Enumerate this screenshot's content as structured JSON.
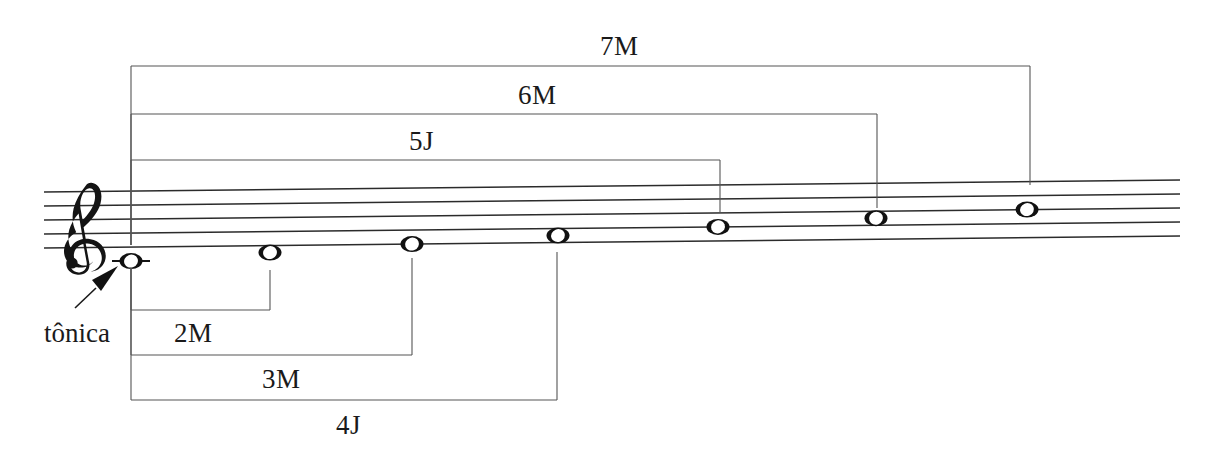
{
  "figure": {
    "kind": "music-staff-intervals",
    "clef": "treble-clef",
    "staff": {
      "line_count": 5,
      "left_x": 44,
      "right_x": 1180,
      "left_top_y": 192,
      "line_spacing": 14,
      "tilt_px": -12,
      "color": "#2b2b2b"
    },
    "tonic": {
      "label": "tônica",
      "arrow": "arrow-up-right",
      "label_x": 44,
      "label_y": 320
    },
    "notes": [
      {
        "id": "note-1",
        "degree": "1",
        "x": 131,
        "staff_pos": -2,
        "ledger": true,
        "name": "tonic-note"
      },
      {
        "id": "note-2",
        "degree": "2",
        "x": 270,
        "staff_pos": -1,
        "ledger": false,
        "name": "second-note"
      },
      {
        "id": "note-3",
        "degree": "3",
        "x": 412,
        "staff_pos": 0,
        "ledger": false,
        "name": "third-note"
      },
      {
        "id": "note-4",
        "degree": "4",
        "x": 558,
        "staff_pos": 1,
        "ledger": false,
        "name": "fourth-note"
      },
      {
        "id": "note-5",
        "degree": "5",
        "x": 718,
        "staff_pos": 2,
        "ledger": false,
        "name": "fifth-note"
      },
      {
        "id": "note-6",
        "degree": "6",
        "x": 876,
        "staff_pos": 3,
        "ledger": false,
        "name": "sixth-note"
      },
      {
        "id": "note-7",
        "degree": "7",
        "x": 1027,
        "staff_pos": 4,
        "ledger": false,
        "name": "seventh-note"
      }
    ],
    "brackets_above": [
      {
        "id": "bracket-5j",
        "label": "5J",
        "x1": 131,
        "x2": 720,
        "bar_y": 160,
        "left_drop_y": 245,
        "right_drop_y": 212,
        "label_x": 409,
        "label_y": 128
      },
      {
        "id": "bracket-6m",
        "label": "6M",
        "x1": 131,
        "x2": 877,
        "bar_y": 114,
        "left_drop_y": 245,
        "right_drop_y": 208,
        "label_x": 518,
        "label_y": 82
      },
      {
        "id": "bracket-7m",
        "label": "7M",
        "x1": 131,
        "x2": 1030,
        "bar_y": 66,
        "left_drop_y": 245,
        "right_drop_y": 185,
        "label_x": 600,
        "label_y": 33
      }
    ],
    "brackets_below": [
      {
        "id": "bracket-2m",
        "label": "2M",
        "x1": 131,
        "x2": 270,
        "bar_y": 310,
        "left_rise_y": 268,
        "right_rise_y": 270,
        "label_x": 174,
        "label_y": 320
      },
      {
        "id": "bracket-3m",
        "label": "3M",
        "x1": 131,
        "x2": 412,
        "bar_y": 355,
        "left_rise_y": 268,
        "right_rise_y": 258,
        "label_x": 262,
        "label_y": 366
      },
      {
        "id": "bracket-4j",
        "label": "4J",
        "x1": 131,
        "x2": 557,
        "bar_y": 400,
        "left_rise_y": 268,
        "right_rise_y": 252,
        "label_x": 336,
        "label_y": 412
      }
    ],
    "colors": {
      "ink": "#1a1a1a",
      "staff": "#2b2b2b",
      "bracket": "#555555",
      "background": "#ffffff"
    }
  }
}
